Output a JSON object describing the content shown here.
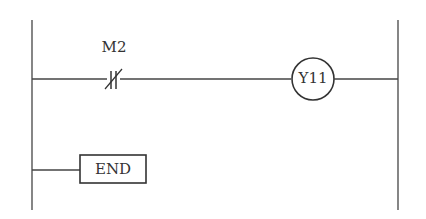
{
  "diagram": {
    "type": "ladder-logic",
    "rungs": [
      {
        "contact": {
          "label": "M2",
          "kind": "normally-closed"
        },
        "coil": {
          "label": "Y11"
        }
      },
      {
        "instruction": {
          "label": "END"
        }
      }
    ],
    "colors": {
      "line": "#444444",
      "background": "#ffffff"
    }
  }
}
